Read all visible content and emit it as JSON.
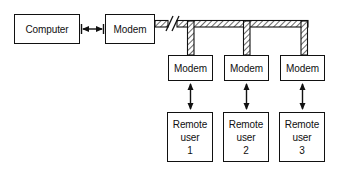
{
  "diagram": {
    "colors": {
      "stroke": "#111111",
      "background": "#ffffff",
      "hatch": "#333333"
    },
    "host": {
      "computer_label": "Computer",
      "modem_label": "Modem"
    },
    "link": {
      "host_link_type": "double-headed-arrow",
      "trunk_type": "hatched-cable",
      "break_symbol": "//"
    },
    "branches": [
      {
        "modem_label": "Modem",
        "user_line_1": "Remote",
        "user_line_2": "user",
        "user_line_3": "1"
      },
      {
        "modem_label": "Modem",
        "user_line_1": "Remote",
        "user_line_2": "user",
        "user_line_3": "2"
      },
      {
        "modem_label": "Modem",
        "user_line_1": "Remote",
        "user_line_2": "user",
        "user_line_3": "3"
      }
    ]
  }
}
